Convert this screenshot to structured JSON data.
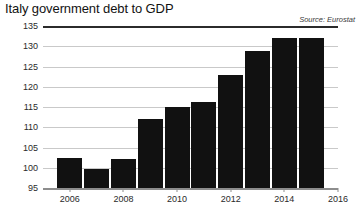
{
  "chart_data": {
    "type": "bar",
    "title": "Italy government debt to GDP",
    "source": "Source: Eurostat",
    "xlabel": "",
    "ylabel": "",
    "ylim": [
      95,
      135
    ],
    "ytick_values": [
      95,
      100,
      105,
      110,
      115,
      120,
      125,
      130,
      135
    ],
    "ytick_labels": [
      "95",
      "100",
      "105",
      "110",
      "115",
      "120",
      "125",
      "130",
      "135"
    ],
    "xtick_values": [
      2006,
      2008,
      2010,
      2012,
      2014,
      2016
    ],
    "xtick_labels": [
      "2006",
      "2008",
      "2010",
      "2012",
      "2014",
      "2016"
    ],
    "xlim": [
      2005.5,
      2016.5
    ],
    "grid": true,
    "legend": false,
    "bar_color": "#111111",
    "categories": [
      2006,
      2007,
      2008,
      2009,
      2010,
      2011,
      2012,
      2013,
      2014,
      2015
    ],
    "values": [
      102.5,
      99.7,
      102.2,
      112.1,
      115.0,
      116.2,
      123.0,
      128.8,
      132.0,
      132.1
    ],
    "points": [
      {
        "year": "2006",
        "value": 102.5
      },
      {
        "year": "2007",
        "value": 99.7
      },
      {
        "year": "2008",
        "value": 102.2
      },
      {
        "year": "2009",
        "value": 112.1
      },
      {
        "year": "2010",
        "value": 115.0
      },
      {
        "year": "2011",
        "value": 116.2
      },
      {
        "year": "2012",
        "value": 123.0
      },
      {
        "year": "2013",
        "value": 128.8
      },
      {
        "year": "2014",
        "value": 132.0
      },
      {
        "year": "2015",
        "value": 132.1
      }
    ]
  }
}
